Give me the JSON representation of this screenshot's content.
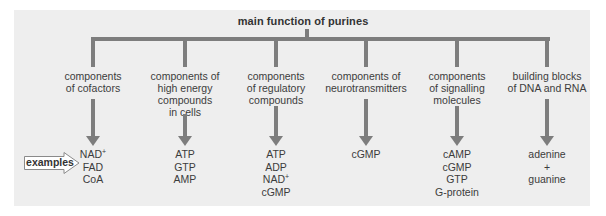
{
  "diagram": {
    "title": "main function of purines",
    "examples_label": "examples",
    "colors": {
      "panel_background": "#eeeeee",
      "line_color": "#7d7d7d",
      "text_color": "#3c3c3c"
    },
    "functions": [
      {
        "label_lines": [
          "components",
          "of cofactors"
        ],
        "examples": [
          "NAD+",
          "FAD",
          "CoA"
        ]
      },
      {
        "label_lines": [
          "components of",
          "high energy",
          "compounds",
          "in cells"
        ],
        "examples": [
          "ATP",
          "GTP",
          "AMP"
        ]
      },
      {
        "label_lines": [
          "components",
          "of regulatory",
          "compounds"
        ],
        "examples": [
          "ATP",
          "ADP",
          "NAD+",
          "cGMP"
        ]
      },
      {
        "label_lines": [
          "components of",
          "neurotransmitters"
        ],
        "examples": [
          "cGMP"
        ]
      },
      {
        "label_lines": [
          "components",
          "of signalling",
          "molecules"
        ],
        "examples": [
          "cAMP",
          "cGMP",
          "GTP",
          "G-protein"
        ]
      },
      {
        "label_lines": [
          "building blocks",
          "of DNA and RNA"
        ],
        "examples": [
          "adenine",
          "+",
          "guanine"
        ]
      }
    ]
  }
}
